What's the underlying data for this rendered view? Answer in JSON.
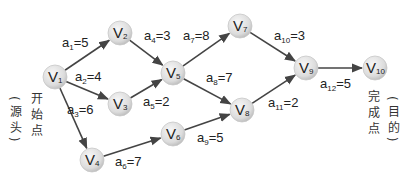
{
  "diagram": {
    "type": "AOE activity network",
    "nodes": [
      {
        "id": "V1",
        "base": "V",
        "sub": "1",
        "x": 55,
        "y": 77
      },
      {
        "id": "V2",
        "base": "V",
        "sub": "2",
        "x": 120,
        "y": 33
      },
      {
        "id": "V3",
        "base": "V",
        "sub": "3",
        "x": 120,
        "y": 104
      },
      {
        "id": "V4",
        "base": "V",
        "sub": "4",
        "x": 92,
        "y": 160
      },
      {
        "id": "V5",
        "base": "V",
        "sub": "5",
        "x": 173,
        "y": 73
      },
      {
        "id": "V6",
        "base": "V",
        "sub": "6",
        "x": 173,
        "y": 134
      },
      {
        "id": "V7",
        "base": "V",
        "sub": "7",
        "x": 240,
        "y": 26
      },
      {
        "id": "V8",
        "base": "V",
        "sub": "8",
        "x": 242,
        "y": 110
      },
      {
        "id": "V9",
        "base": "V",
        "sub": "9",
        "x": 306,
        "y": 68
      },
      {
        "id": "V10",
        "base": "V",
        "sub": "10",
        "x": 375,
        "y": 68
      }
    ],
    "edges": [
      {
        "from": "V1",
        "to": "V2",
        "name": "a",
        "sub": "1",
        "weight": "5",
        "lx": 62,
        "ly": 47
      },
      {
        "from": "V1",
        "to": "V3",
        "name": "a",
        "sub": "2",
        "weight": "4",
        "lx": 75,
        "ly": 81
      },
      {
        "from": "V1",
        "to": "V4",
        "name": "a",
        "sub": "3",
        "weight": "6",
        "lx": 67,
        "ly": 114
      },
      {
        "from": "V2",
        "to": "V5",
        "name": "a",
        "sub": "4",
        "weight": "3",
        "lx": 144,
        "ly": 40
      },
      {
        "from": "V3",
        "to": "V5",
        "name": "a",
        "sub": "5",
        "weight": "2",
        "lx": 143,
        "ly": 106
      },
      {
        "from": "V4",
        "to": "V6",
        "name": "a",
        "sub": "6",
        "weight": "7",
        "lx": 115,
        "ly": 166
      },
      {
        "from": "V5",
        "to": "V7",
        "name": "a",
        "sub": "7",
        "weight": "8",
        "lx": 183,
        "ly": 40
      },
      {
        "from": "V5",
        "to": "V8",
        "name": "a",
        "sub": "8",
        "weight": "7",
        "lx": 206,
        "ly": 82
      },
      {
        "from": "V6",
        "to": "V8",
        "name": "a",
        "sub": "9",
        "weight": "5",
        "lx": 197,
        "ly": 142
      },
      {
        "from": "V7",
        "to": "V9",
        "name": "a",
        "sub": "10",
        "weight": "3",
        "lx": 274,
        "ly": 40
      },
      {
        "from": "V8",
        "to": "V9",
        "name": "a",
        "sub": "11",
        "weight": "2",
        "lx": 268,
        "ly": 107
      },
      {
        "from": "V9",
        "to": "V10",
        "name": "a",
        "sub": "12",
        "weight": "5",
        "lx": 320,
        "ly": 88
      }
    ],
    "annotations": {
      "start_main": "开始点",
      "start_paren": "(源头)",
      "end_main": "完成点",
      "end_paren": "(目的)"
    },
    "colors": {
      "edge": "#444444",
      "node_fill_center": "#f2f2f2",
      "node_fill_edge": "#bdbdbd",
      "text": "#222222"
    }
  }
}
